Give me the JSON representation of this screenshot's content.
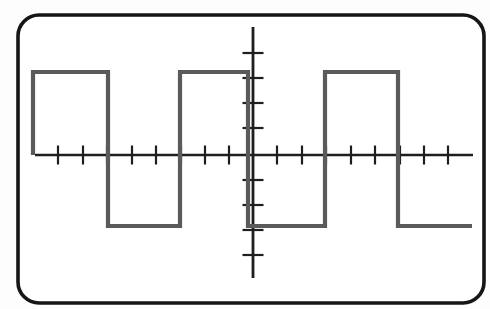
{
  "scene": {
    "description": "Textbook oscilloscope-screen drawing of a square wave on crosshair graticule axes; no text labels visible",
    "colors": {
      "background": "#fdfdfd",
      "screen_fill": "#ffffff",
      "bezel_stroke": "#161616",
      "axis_stroke": "#1e1e1e",
      "tick_stroke": "#1e1e1e",
      "trace_stroke": "#5a5a5a"
    },
    "bezel_px": {
      "x": 18,
      "y": 15,
      "width": 466,
      "height": 288,
      "radius": 21,
      "stroke_width": 3.6
    }
  },
  "chart_data": {
    "type": "line",
    "waveform": "square",
    "title": "",
    "subtitle": "",
    "xlabel": "",
    "ylabel": "",
    "legend": [],
    "annotations": [],
    "axes": {
      "style": "centered crosshair axes with tick marks, no full grid, no numeric labels",
      "origin_px": [
        253,
        155
      ],
      "px_per_div_x": 24.4,
      "px_per_div_y": 25.5,
      "x_range_div": [
        -9,
        9
      ],
      "y_range_div": [
        -5,
        5
      ],
      "h_axis_px": {
        "x1": 35,
        "x2": 473,
        "y": 155,
        "width": 2.4
      },
      "v_axis_px": {
        "y1": 27,
        "y2": 278,
        "x": 253,
        "width": 2.8
      },
      "h_tick_xs_px": [
        58,
        83,
        107,
        132,
        156,
        181,
        205,
        229,
        277,
        302,
        326,
        351,
        375,
        400,
        424,
        448
      ],
      "v_tick_ys_px": [
        53,
        78,
        103,
        128,
        180,
        205,
        230,
        255
      ],
      "h_tick_half_len_px": 9.5,
      "v_tick_half_len_px": 10.5,
      "tick_width": 2.2
    },
    "series": [
      {
        "name": "square-wave-trace",
        "high_level_div": 3.25,
        "low_level_div": -2.78,
        "period_div": 6,
        "edge_xs_div": [
          -9,
          -6,
          -3,
          0,
          3,
          6,
          9
        ],
        "starts_at": "axis level at far left, rising edge first",
        "ends_at": "low level at far right",
        "points_px": [
          [
            33,
            155
          ],
          [
            33,
            72
          ],
          [
            108,
            72
          ],
          [
            108,
            226
          ],
          [
            180,
            226
          ],
          [
            180,
            72
          ],
          [
            248,
            72
          ],
          [
            248,
            226
          ],
          [
            325,
            226
          ],
          [
            325,
            72
          ],
          [
            398,
            72
          ],
          [
            398,
            226
          ],
          [
            472,
            226
          ]
        ],
        "stroke_width": 4.2
      }
    ]
  }
}
